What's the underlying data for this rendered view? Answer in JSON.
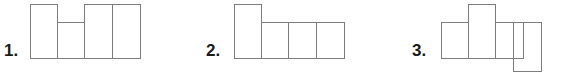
{
  "page": {
    "kind": "math-worksheet-figures",
    "background_color": "#ffffff",
    "line_color": "#7d7d7d",
    "label_color": "#1a1a1a",
    "cell_size_px": 27
  },
  "problems": [
    {
      "id": "problem-1",
      "label": "1.",
      "label_x": 4,
      "label_y": 42,
      "shape_name": "h-shape-four-squares",
      "cells": [
        {
          "x": 30,
          "y": 4,
          "w": 28,
          "h": 55
        },
        {
          "x": 57,
          "y": 22,
          "w": 28,
          "h": 37
        },
        {
          "x": 84,
          "y": 4,
          "w": 29,
          "h": 55
        },
        {
          "x": 112,
          "y": 4,
          "w": 29,
          "h": 55
        }
      ]
    },
    {
      "id": "problem-2",
      "label": "2.",
      "label_x": 206,
      "label_y": 42,
      "shape_name": "l-shape-four-squares",
      "cells": [
        {
          "x": 234,
          "y": 4,
          "w": 28,
          "h": 55
        },
        {
          "x": 261,
          "y": 22,
          "w": 28,
          "h": 37
        },
        {
          "x": 288,
          "y": 22,
          "w": 29,
          "h": 37
        },
        {
          "x": 316,
          "y": 22,
          "w": 29,
          "h": 37
        }
      ]
    },
    {
      "id": "problem-3",
      "label": "3.",
      "label_x": 412,
      "label_y": 42,
      "shape_name": "zigzag-shape-four-squares",
      "cells": [
        {
          "x": 441,
          "y": 22,
          "w": 28,
          "h": 37
        },
        {
          "x": 468,
          "y": 4,
          "w": 28,
          "h": 55
        },
        {
          "x": 495,
          "y": 22,
          "w": 29,
          "h": 37
        },
        {
          "x": 513,
          "y": 22,
          "w": 29,
          "h": 50
        }
      ]
    }
  ]
}
